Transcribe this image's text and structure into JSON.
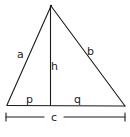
{
  "diagram": {
    "type": "triangle-with-altitude",
    "line_color": "#1a1a1a",
    "background": "#ffffff",
    "labels": {
      "side_a": "a",
      "side_b": "b",
      "height": "h",
      "segment_p": "p",
      "segment_q": "q",
      "base_c": "c"
    },
    "vertices": {
      "apex": [
        51,
        6
      ],
      "base_left": [
        7,
        105
      ],
      "base_right": [
        125,
        106
      ],
      "altitude_foot": [
        50,
        105
      ]
    }
  }
}
